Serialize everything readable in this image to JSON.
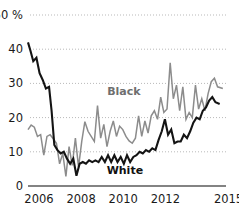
{
  "chart_data": {
    "type": "line",
    "title": "",
    "subtitle": "",
    "xlabel": "",
    "ylabel": "",
    "ylim": [
      0,
      50
    ],
    "xlim": [
      2006,
      2015.4
    ],
    "grid": true,
    "grid_axis": "y",
    "legend": "inline-annotations",
    "y_ticks": [
      0,
      10,
      20,
      30,
      40,
      50
    ],
    "y_tick_labels": [
      "0",
      "10",
      "20",
      "30",
      "40",
      "50 %"
    ],
    "x_ticks": [
      2006,
      2008,
      2010,
      2012,
      2015
    ],
    "x_tick_labels": [
      "2006",
      "2008",
      "2010",
      "2012",
      "2015"
    ],
    "annotations": [
      {
        "text": "Black",
        "x": 2010.55,
        "y": 26.5,
        "color": "#6f6f6f"
      },
      {
        "text": "White",
        "x": 2010.6,
        "y": 3.4,
        "color": "#111111"
      }
    ],
    "series": [
      {
        "name": "Black",
        "color": "#8c8c8c",
        "stroke_width": 1.5,
        "x": [
          2006.0,
          2006.15,
          2006.3,
          2006.45,
          2006.6,
          2006.75,
          2006.9,
          2007.05,
          2007.2,
          2007.35,
          2007.5,
          2007.65,
          2007.8,
          2007.95,
          2008.1,
          2008.25,
          2008.4,
          2008.55,
          2008.7,
          2008.85,
          2009.0,
          2009.15,
          2009.3,
          2009.45,
          2009.6,
          2009.75,
          2009.9,
          2010.05,
          2010.2,
          2010.35,
          2010.5,
          2010.65,
          2010.8,
          2010.95,
          2011.1,
          2011.25,
          2011.4,
          2011.55,
          2011.7,
          2011.85,
          2012.0,
          2012.15,
          2012.3,
          2012.45,
          2012.6,
          2012.75,
          2012.9,
          2013.05,
          2013.2,
          2013.35,
          2013.5,
          2013.65,
          2013.8,
          2013.95,
          2014.1,
          2014.25,
          2014.4,
          2014.55,
          2014.7,
          2014.85,
          2015.0,
          2015.25
        ],
        "values": [
          16.5,
          17.8,
          17.2,
          14.5,
          15.0,
          9.0,
          14.5,
          15.0,
          13.8,
          12.5,
          6.5,
          9.5,
          2.8,
          11.5,
          6.0,
          14.0,
          5.5,
          13.0,
          18.8,
          16.0,
          14.5,
          13.0,
          23.5,
          14.0,
          18.0,
          11.5,
          16.0,
          19.0,
          14.5,
          17.5,
          16.5,
          14.5,
          13.2,
          12.5,
          14.0,
          20.5,
          14.5,
          19.0,
          15.5,
          20.5,
          22.0,
          19.5,
          26.0,
          21.5,
          22.5,
          36.0,
          25.5,
          29.5,
          22.0,
          29.0,
          19.5,
          21.5,
          20.0,
          29.5,
          22.5,
          25.5,
          22.0,
          27.0,
          30.5,
          31.5,
          29.0,
          28.5
        ]
      },
      {
        "name": "White",
        "color": "#141414",
        "stroke_width": 2.1,
        "x": [
          2006.0,
          2006.12,
          2006.25,
          2006.4,
          2006.55,
          2006.7,
          2006.85,
          2007.0,
          2007.12,
          2007.25,
          2007.4,
          2007.55,
          2007.7,
          2007.85,
          2008.0,
          2008.15,
          2008.3,
          2008.45,
          2008.6,
          2008.75,
          2008.9,
          2009.05,
          2009.2,
          2009.35,
          2009.5,
          2009.65,
          2009.8,
          2009.95,
          2010.1,
          2010.25,
          2010.4,
          2010.55,
          2010.7,
          2010.85,
          2011.0,
          2011.15,
          2011.3,
          2011.45,
          2011.6,
          2011.75,
          2011.9,
          2012.05,
          2012.2,
          2012.35,
          2012.5,
          2012.65,
          2012.8,
          2012.95,
          2013.1,
          2013.25,
          2013.4,
          2013.55,
          2013.7,
          2013.85,
          2014.0,
          2014.15,
          2014.3,
          2014.45,
          2014.6,
          2014.75,
          2014.9,
          2015.1
        ],
        "values": [
          42.0,
          39.5,
          36.5,
          37.5,
          33.0,
          31.0,
          28.5,
          29.0,
          22.0,
          12.0,
          10.5,
          9.5,
          10.0,
          8.0,
          6.5,
          8.0,
          3.0,
          6.5,
          7.0,
          6.5,
          7.5,
          7.0,
          7.5,
          7.0,
          8.5,
          7.0,
          9.0,
          7.0,
          9.0,
          7.0,
          8.5,
          6.5,
          9.0,
          7.0,
          8.5,
          9.0,
          10.0,
          9.5,
          10.5,
          10.0,
          11.0,
          10.5,
          13.5,
          16.0,
          19.5,
          15.0,
          16.5,
          12.5,
          13.0,
          13.0,
          15.0,
          14.0,
          16.0,
          18.5,
          20.0,
          19.5,
          22.0,
          23.0,
          25.0,
          26.0,
          24.5,
          24.0
        ]
      }
    ]
  },
  "axis": {
    "baseline_color": "#5a5a5a",
    "gridline_color": "#b9b9b9"
  }
}
